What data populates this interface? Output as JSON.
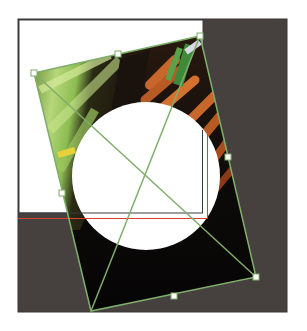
{
  "canvas": {
    "width": 307,
    "height": 331,
    "background": "#ffffff",
    "artboard": {
      "x": 18,
      "y": 19,
      "width": 269,
      "height": 293,
      "fill": "#46403f",
      "stroke": "#3a3434"
    },
    "page": {
      "x": 19,
      "y": 20,
      "width": 184,
      "height": 193,
      "fill": "#ffffff",
      "stroke": "#3a3a44"
    },
    "bleed_guide": {
      "color": "#d8412f",
      "x2": 207,
      "y": 218,
      "top": 133
    }
  },
  "image_frame": {
    "label": "Placed image (carrots and leeks) with circular cutout",
    "corners": {
      "tl": [
        34,
        73
      ],
      "tr": [
        200,
        36
      ],
      "br": [
        256,
        277
      ],
      "bl": [
        91,
        311
      ]
    },
    "handles": {
      "top_mid": [
        118,
        54
      ],
      "right_mid": [
        228,
        157
      ],
      "bottom_mid": [
        174,
        296
      ],
      "left_mid": [
        62,
        193
      ]
    },
    "stroke_color": "#7fae6a",
    "handle_fill": "#ffffff",
    "handle_stroke": "#7fae6a"
  },
  "cutout": {
    "cx": 146,
    "cy": 176,
    "r": 74,
    "fill": "#ffffff"
  },
  "colors": {
    "leek_light": "#b6d77a",
    "leek_mid": "#7fb24a",
    "leek_dark": "#3f6a22",
    "carrot": "#c8672b",
    "carrot_dark": "#8a3a16",
    "shadow": "#0d0b0a",
    "highlight": "#d9d7e6"
  }
}
